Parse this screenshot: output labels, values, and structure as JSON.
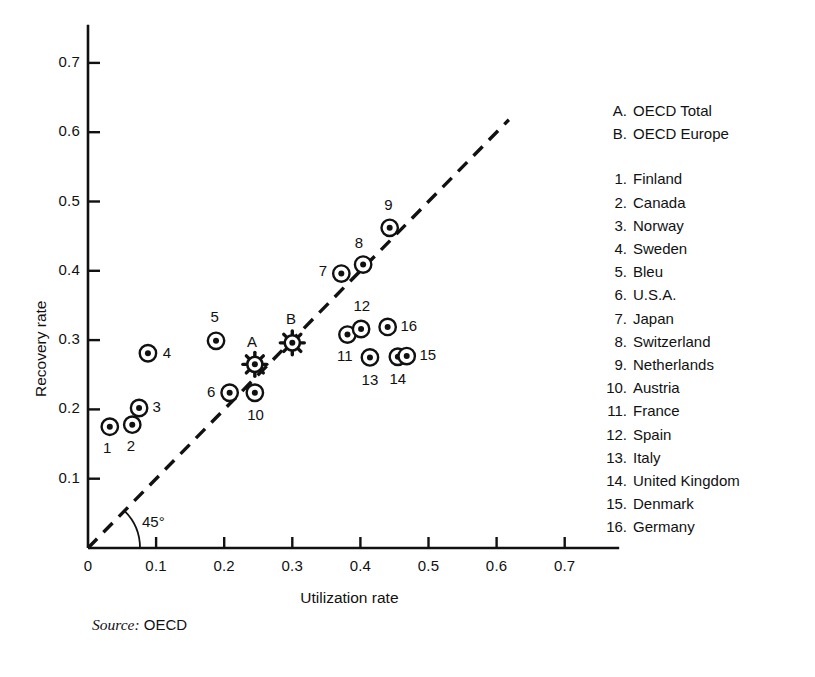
{
  "chart_data": {
    "type": "scatter",
    "title": "",
    "xlabel": "Utilization rate",
    "ylabel": "Recovery rate",
    "xlim": [
      0.0,
      0.78
    ],
    "ylim": [
      0.0,
      0.755
    ],
    "xticks": [
      "0",
      "0.1",
      "0.2",
      "0.3",
      "0.4",
      "0.5",
      "0.6",
      "0.7"
    ],
    "xtick_values": [
      0.0,
      0.1,
      0.2,
      0.3,
      0.4,
      0.5,
      0.6,
      0.7
    ],
    "yticks": [
      "0.1",
      "0.2",
      "0.3",
      "0.4",
      "0.5",
      "0.6",
      "0.7"
    ],
    "ytick_values": [
      0.1,
      0.2,
      0.3,
      0.4,
      0.5,
      0.6,
      0.7
    ],
    "grid": false,
    "legend_position": "right",
    "reference_line": {
      "label": "45°",
      "style": "dashed",
      "slope": 1,
      "intercept": 0,
      "x_start": 0.0,
      "x_end": 0.618
    },
    "points": [
      {
        "key": "A",
        "name": "OECD Total",
        "x": 0.245,
        "y": 0.265,
        "marker": "starburst",
        "label_dx": -0.004,
        "label_dy": 0.032
      },
      {
        "key": "B",
        "name": "OECD Europe",
        "x": 0.3,
        "y": 0.296,
        "marker": "starburst",
        "label_dx": -0.002,
        "label_dy": 0.034
      },
      {
        "key": "1",
        "name": "Finland",
        "x": 0.032,
        "y": 0.175,
        "marker": "circle-dot",
        "label_dx": -0.004,
        "label_dy": -0.031
      },
      {
        "key": "2",
        "name": "Canada",
        "x": 0.065,
        "y": 0.178,
        "marker": "circle-dot",
        "label_dx": -0.002,
        "label_dy": -0.031
      },
      {
        "key": "3",
        "name": "Norway",
        "x": 0.075,
        "y": 0.202,
        "marker": "circle-dot",
        "label_dx": 0.026,
        "label_dy": 0.002
      },
      {
        "key": "4",
        "name": "Sweden",
        "x": 0.088,
        "y": 0.281,
        "marker": "circle-dot",
        "label_dx": 0.028,
        "label_dy": 0.001
      },
      {
        "key": "5",
        "name": "Bleu",
        "x": 0.188,
        "y": 0.299,
        "marker": "circle-dot",
        "label_dx": -0.002,
        "label_dy": 0.034
      },
      {
        "key": "6",
        "name": "U.S.A.",
        "x": 0.208,
        "y": 0.224,
        "marker": "circle-dot",
        "label_dx": -0.027,
        "label_dy": 0.001
      },
      {
        "key": "7",
        "name": "Japan",
        "x": 0.372,
        "y": 0.396,
        "marker": "circle-dot",
        "label_dx": -0.027,
        "label_dy": 0.003
      },
      {
        "key": "8",
        "name": "Switzerland",
        "x": 0.404,
        "y": 0.409,
        "marker": "circle-dot",
        "label_dx": -0.006,
        "label_dy": 0.031
      },
      {
        "key": "9",
        "name": "Netherlands",
        "x": 0.443,
        "y": 0.462,
        "marker": "circle-dot",
        "label_dx": -0.002,
        "label_dy": 0.033
      },
      {
        "key": "10",
        "name": "Austria",
        "x": 0.245,
        "y": 0.224,
        "marker": "circle-dot",
        "label_dx": 0.001,
        "label_dy": -0.032
      },
      {
        "key": "11",
        "name": "France",
        "x": 0.381,
        "y": 0.308,
        "marker": "circle-dot",
        "label_dx": -0.004,
        "label_dy": -0.031
      },
      {
        "key": "12",
        "name": "Spain",
        "x": 0.401,
        "y": 0.316,
        "marker": "circle-dot",
        "label_dx": 0.001,
        "label_dy": 0.033
      },
      {
        "key": "13",
        "name": "Italy",
        "x": 0.414,
        "y": 0.275,
        "marker": "circle-dot",
        "label_dx": 0.0,
        "label_dy": -0.032
      },
      {
        "key": "14",
        "name": "United Kingdom",
        "x": 0.455,
        "y": 0.276,
        "marker": "circle-dot",
        "label_dx": 0.0,
        "label_dy": -0.032
      },
      {
        "key": "15",
        "name": "Denmark",
        "x": 0.468,
        "y": 0.277,
        "marker": "circle-dot",
        "label_dx": 0.031,
        "label_dy": 0.002
      },
      {
        "key": "16",
        "name": "Germany",
        "x": 0.44,
        "y": 0.319,
        "marker": "circle-dot",
        "label_dx": 0.031,
        "label_dy": 0.002
      }
    ]
  },
  "legend": {
    "groups": [
      [
        {
          "key": "A.",
          "name": "OECD Total"
        },
        {
          "key": "B.",
          "name": "OECD Europe"
        }
      ],
      [
        {
          "key": "1.",
          "name": "Finland"
        },
        {
          "key": "2.",
          "name": "Canada"
        },
        {
          "key": "3.",
          "name": "Norway"
        },
        {
          "key": "4.",
          "name": "Sweden"
        },
        {
          "key": "5.",
          "name": "Bleu"
        },
        {
          "key": "6.",
          "name": "U.S.A."
        },
        {
          "key": "7.",
          "name": "Japan"
        },
        {
          "key": "8.",
          "name": "Switzerland"
        },
        {
          "key": "9.",
          "name": "Netherlands"
        },
        {
          "key": "10.",
          "name": "Austria"
        },
        {
          "key": "11.",
          "name": "France"
        },
        {
          "key": "12.",
          "name": "Spain"
        },
        {
          "key": "13.",
          "name": "Italy"
        },
        {
          "key": "14.",
          "name": "United Kingdom"
        },
        {
          "key": "15.",
          "name": "Denmark"
        },
        {
          "key": "16.",
          "name": "Germany"
        }
      ]
    ]
  },
  "source": {
    "label": "Source:",
    "value": "OECD"
  },
  "caption": {
    "text": ""
  },
  "colors": {
    "ink": "#111111",
    "background": "#ffffff",
    "caption_ghost": "#c9c9c9"
  }
}
